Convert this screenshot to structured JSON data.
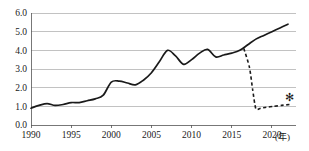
{
  "chart_data": {
    "type": "line",
    "title": "",
    "subtitle": "",
    "xlabel": "(年)",
    "ylabel": "",
    "xlim": [
      1990,
      2023
    ],
    "ylim": [
      0.0,
      6.0
    ],
    "grid": true,
    "legend_position": "none",
    "x_ticks": [
      1990,
      1995,
      2000,
      2005,
      2010,
      2015,
      2020
    ],
    "x_tick_labels": [
      "1990",
      "1995",
      "2000",
      "2005",
      "2010",
      "2015",
      "2020"
    ],
    "y_ticks": [
      0.0,
      1.0,
      2.0,
      3.0,
      4.0,
      5.0,
      6.0
    ],
    "y_tick_labels": [
      "0.0",
      "1.0",
      "2.0",
      "3.0",
      "4.0",
      "5.0",
      "6.0"
    ],
    "unit_label": "(年)",
    "series": [
      {
        "name": "solid-series",
        "style": "solid",
        "color": "#1a1a1a",
        "x": [
          1990,
          1991,
          1992,
          1993,
          1994,
          1995,
          1996,
          1997,
          1998,
          1999,
          2000,
          2001,
          2002,
          2003,
          2004,
          2005,
          2006,
          2007,
          2008,
          2009,
          2010,
          2011,
          2012,
          2013,
          2014,
          2015,
          2016,
          2017,
          2018,
          2019,
          2020,
          2021,
          2022
        ],
        "values": [
          0.9,
          1.05,
          1.15,
          1.05,
          1.1,
          1.2,
          1.2,
          1.3,
          1.4,
          1.6,
          2.3,
          2.35,
          2.25,
          2.15,
          2.4,
          2.8,
          3.4,
          4.0,
          3.7,
          3.25,
          3.5,
          3.85,
          4.05,
          3.65,
          3.75,
          3.85,
          4.0,
          4.3,
          4.6,
          4.8,
          5.0,
          5.2,
          5.4
        ]
      },
      {
        "name": "dashed-series",
        "style": "dashed",
        "color": "#1a1a1a",
        "x": [
          2016.5,
          2017.2,
          2017.6,
          2018.0,
          2018.6,
          2019.3,
          2020.2,
          2021.2,
          2022.2
        ],
        "values": [
          4.1,
          3.1,
          1.9,
          0.87,
          0.9,
          0.95,
          1.0,
          1.05,
          1.1
        ]
      }
    ],
    "annotations": [
      {
        "name": "asterisk-marker",
        "symbol": "✻",
        "x": 2022.2,
        "y": 1.5
      }
    ]
  }
}
